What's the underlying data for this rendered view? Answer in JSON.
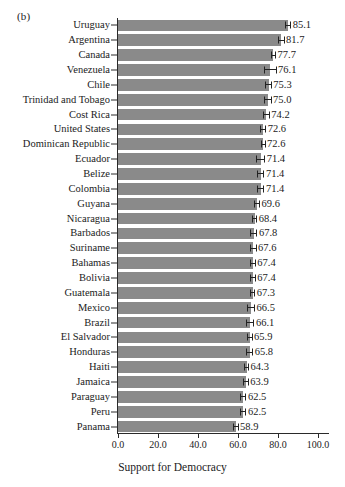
{
  "figure": {
    "panel_label": "(b)",
    "x_axis_title": "Support for Democracy",
    "x_tick_labels": [
      "0.0",
      "20.0",
      "40.0",
      "60.0",
      "80.0",
      "100.0"
    ]
  },
  "chart_data": {
    "type": "bar",
    "orientation": "horizontal",
    "title": "(b)",
    "xlabel": "Support for Democracy",
    "ylabel": "",
    "xlim": [
      0,
      106
    ],
    "xticks": [
      0,
      20,
      40,
      60,
      80,
      100
    ],
    "grid": false,
    "legend": null,
    "bar_color": "#8a8a8a",
    "error_bar_color": "#232323",
    "categories": [
      "Uruguay",
      "Argentina",
      "Canada",
      "Venezuela",
      "Chile",
      "Trinidad and Tobago",
      "Cost Rica",
      "United States",
      "Dominican Republic",
      "Ecuador",
      "Belize",
      "Colombia",
      "Guyana",
      "Nicaragua",
      "Barbados",
      "Suriname",
      "Bahamas",
      "Bolivia",
      "Guatemala",
      "Mexico",
      "Brazil",
      "El Salvador",
      "Honduras",
      "Haiti",
      "Jamaica",
      "Paraguay",
      "Peru",
      "Panama"
    ],
    "values": [
      85.1,
      81.7,
      77.7,
      76.1,
      75.3,
      75.0,
      74.2,
      72.6,
      72.6,
      71.4,
      71.4,
      71.4,
      69.6,
      68.4,
      67.8,
      67.6,
      67.4,
      67.4,
      67.3,
      66.5,
      66.1,
      65.9,
      65.8,
      64.3,
      63.9,
      62.5,
      62.5,
      58.9
    ],
    "value_labels": [
      "85.1",
      "81.7",
      "77.7",
      "76.1",
      "75.3",
      "75.0",
      "74.2",
      "72.6",
      "72.6",
      "71.4",
      "71.4",
      "71.4",
      "69.6",
      "68.4",
      "67.8",
      "67.6",
      "67.4",
      "67.4",
      "67.3",
      "66.5",
      "66.1",
      "65.9",
      "65.8",
      "64.3",
      "63.9",
      "62.5",
      "62.5",
      "58.9"
    ],
    "error_margins": [
      1.5,
      1.6,
      1.3,
      3.2,
      1.6,
      1.8,
      1.7,
      1.5,
      1.2,
      2.2,
      1.8,
      1.8,
      1.4,
      1.2,
      1.9,
      1.7,
      1.5,
      1.5,
      1.3,
      2.0,
      2.1,
      1.4,
      1.8,
      1.2,
      1.5,
      1.7,
      1.7,
      1.4
    ]
  }
}
